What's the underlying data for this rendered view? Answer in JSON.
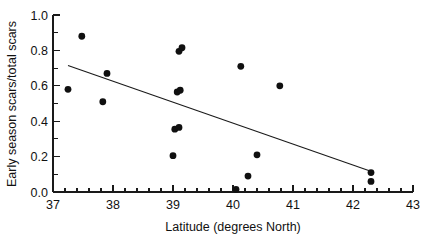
{
  "chart_data": {
    "type": "scatter",
    "title": "",
    "xlabel": "Latitude (degrees North)",
    "ylabel": "Early season scars/total scars",
    "xlim": [
      37,
      43
    ],
    "ylim": [
      0.0,
      1.0
    ],
    "x_ticks": [
      37,
      38,
      39,
      40,
      41,
      42,
      43
    ],
    "x_tick_labels": [
      "37",
      "38",
      "39",
      "40",
      "41",
      "42",
      "43"
    ],
    "x_minor_per_interval": 4,
    "y_ticks": [
      0.0,
      0.2,
      0.4,
      0.6,
      0.8,
      1.0
    ],
    "y_tick_labels": [
      "0.0",
      "0.2",
      "0.4",
      "0.6",
      "0.8",
      "1.0"
    ],
    "y_minor_per_interval": 1,
    "grid": false,
    "legend": false,
    "marker": "filled-circle",
    "marker_color": "#101010",
    "marker_size_px": 4.4,
    "points": [
      {
        "x": 37.25,
        "y": 0.58
      },
      {
        "x": 37.48,
        "y": 0.88
      },
      {
        "x": 37.83,
        "y": 0.51
      },
      {
        "x": 37.9,
        "y": 0.67
      },
      {
        "x": 39.0,
        "y": 0.205
      },
      {
        "x": 39.03,
        "y": 0.355
      },
      {
        "x": 39.1,
        "y": 0.365
      },
      {
        "x": 39.07,
        "y": 0.565
      },
      {
        "x": 39.12,
        "y": 0.575
      },
      {
        "x": 39.1,
        "y": 0.795
      },
      {
        "x": 39.15,
        "y": 0.815
      },
      {
        "x": 40.05,
        "y": 0.015
      },
      {
        "x": 40.13,
        "y": 0.71
      },
      {
        "x": 40.25,
        "y": 0.09
      },
      {
        "x": 40.4,
        "y": 0.21
      },
      {
        "x": 40.78,
        "y": 0.6
      },
      {
        "x": 42.3,
        "y": 0.11
      },
      {
        "x": 42.3,
        "y": 0.06
      }
    ],
    "fit_line": {
      "type": "linear-regression",
      "color": "#1a1a1a",
      "x_start": 37.25,
      "y_start": 0.715,
      "x_end": 42.32,
      "y_end": 0.115
    }
  }
}
